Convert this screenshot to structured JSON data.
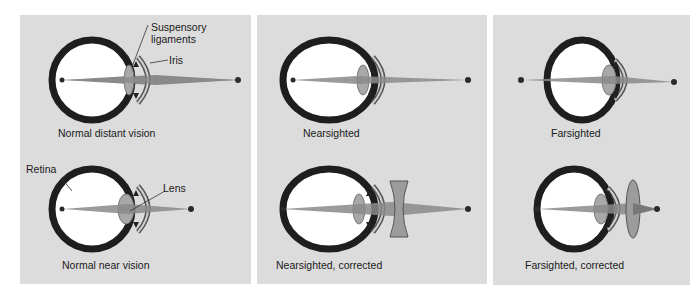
{
  "colors": {
    "panel_bg": "#dcdcdc",
    "eye_wall": "#1e1e1e",
    "eye_interior": "#ffffff",
    "light_ray": "#8a8a8a",
    "lens": "#a8a8a8",
    "corrective_lens": "#9c9c9c",
    "focus_point": "#2a2a2a"
  },
  "panels": [
    {
      "id": "normal",
      "top": {
        "caption": "Normal distant vision",
        "labels": {
          "suspensory": "Suspensory\nligaments",
          "suspensory_line1": "Suspensory",
          "suspensory_line2": "ligaments",
          "iris": "Iris"
        }
      },
      "bottom": {
        "caption": "Normal near vision",
        "labels": {
          "retina": "Retina",
          "lens": "Lens"
        }
      }
    },
    {
      "id": "nearsighted",
      "top": {
        "caption": "Nearsighted"
      },
      "bottom": {
        "caption": "Nearsighted, corrected",
        "corrective_lens": "concave"
      }
    },
    {
      "id": "farsighted",
      "top": {
        "caption": "Farsighted"
      },
      "bottom": {
        "caption": "Farsighted, corrected",
        "corrective_lens": "convex"
      }
    }
  ]
}
